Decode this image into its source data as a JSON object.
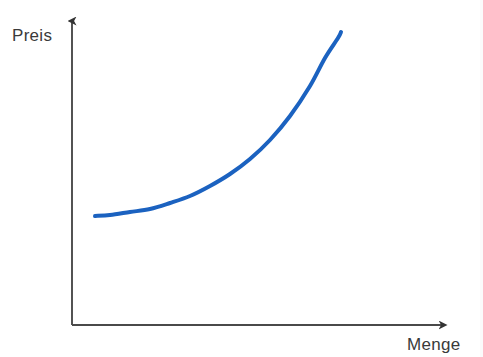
{
  "figure": {
    "background_color": "#ffffff",
    "axis_color": "#4a4a4a",
    "curve_color": "#1b62c0",
    "label_color": "#3a3a3a"
  },
  "axes": {
    "y": {
      "label": "Preis",
      "arrow": "arrow-up",
      "origin_px": [
        72,
        325
      ],
      "tip_px": [
        72,
        14
      ]
    },
    "x": {
      "label": "Menge",
      "arrow": "arrow-right",
      "origin_px": [
        72,
        325
      ],
      "tip_px": [
        450,
        325
      ]
    }
  },
  "chart_data": {
    "type": "line",
    "title": "",
    "subtitle": "",
    "xlabel": "Menge",
    "ylabel": "Preis",
    "xlim": [
      0,
      1
    ],
    "ylim": [
      0,
      1
    ],
    "grid": false,
    "legend": null,
    "axis_ticks": {
      "x": [],
      "y": []
    },
    "annotations": [],
    "series": [
      {
        "name": "Angebotskurve",
        "color": "#1b62c0",
        "line_width": 4,
        "x": [
          0.061,
          0.1,
          0.15,
          0.2,
          0.25,
          0.3,
          0.35,
          0.4,
          0.45,
          0.5,
          0.55,
          0.6,
          0.65,
          0.7,
          0.712
        ],
        "y": [
          0.351,
          0.355,
          0.363,
          0.374,
          0.389,
          0.409,
          0.434,
          0.466,
          0.506,
          0.556,
          0.619,
          0.7,
          0.802,
          0.93,
          0.942
        ],
        "points_px": [
          [
            95,
            216
          ],
          [
            110,
            215
          ],
          [
            130,
            212
          ],
          [
            150,
            209
          ],
          [
            170,
            203
          ],
          [
            190,
            196
          ],
          [
            210,
            186
          ],
          [
            230,
            174
          ],
          [
            250,
            159
          ],
          [
            270,
            140
          ],
          [
            290,
            116
          ],
          [
            310,
            86
          ],
          [
            325,
            58
          ],
          [
            338,
            38
          ],
          [
            341,
            32
          ]
        ]
      }
    ]
  }
}
